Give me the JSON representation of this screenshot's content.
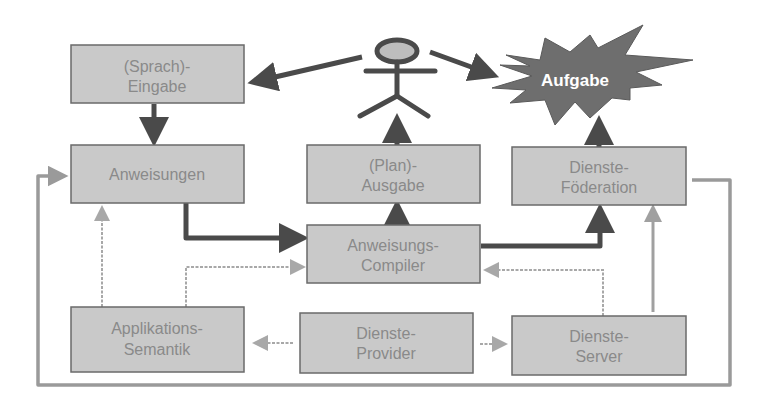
{
  "diagram": {
    "actor": {
      "label": "Nutzer",
      "visible_label": ""
    },
    "goal": {
      "label": "Aufgabe"
    },
    "boxes": {
      "eingabe": {
        "line1": "(Sprach)-",
        "line2": "Eingabe"
      },
      "anweisungen": {
        "line1": "Anweisungen",
        "line2": ""
      },
      "ausgabe": {
        "line1": "(Plan)-",
        "line2": "Ausgabe"
      },
      "foederation": {
        "line1": "Dienste-",
        "line2": "Föderation"
      },
      "compiler": {
        "line1": "Anweisungs-",
        "line2": "Compiler"
      },
      "semantik": {
        "line1": "Applikations-",
        "line2": "Semantik"
      },
      "provider": {
        "line1": "Dienste-",
        "line2": "Provider"
      },
      "server": {
        "line1": "Dienste-",
        "line2": "Server"
      }
    },
    "edges": [
      {
        "from": "actor",
        "to": "eingabe",
        "style": "thick"
      },
      {
        "from": "actor",
        "to": "goal",
        "style": "thick"
      },
      {
        "from": "eingabe",
        "to": "anweisungen",
        "style": "thick"
      },
      {
        "from": "ausgabe",
        "to": "actor",
        "style": "thick"
      },
      {
        "from": "foederation",
        "to": "goal",
        "style": "thick"
      },
      {
        "from": "anweisungen",
        "to": "compiler",
        "style": "thick"
      },
      {
        "from": "compiler",
        "to": "ausgabe",
        "style": "thick"
      },
      {
        "from": "compiler",
        "to": "foederation",
        "style": "thick"
      },
      {
        "from": "semantik",
        "to": "anweisungen",
        "style": "thin"
      },
      {
        "from": "semantik",
        "to": "compiler",
        "style": "thin"
      },
      {
        "from": "server",
        "to": "compiler",
        "style": "thin"
      },
      {
        "from": "server",
        "to": "foederation",
        "style": "thin"
      },
      {
        "from": "provider",
        "to": "semantik",
        "style": "thin"
      },
      {
        "from": "provider",
        "to": "server",
        "style": "thin"
      },
      {
        "from": "foederation",
        "to": "anweisungen",
        "style": "loop"
      }
    ],
    "colors": {
      "box_fill": "#c9c9c9",
      "box_text": "#8a8a8a",
      "thick_arrow": "#4a4a4a",
      "thin_arrow": "#a8a8a8",
      "star_fill": "#6e6e6e"
    }
  }
}
